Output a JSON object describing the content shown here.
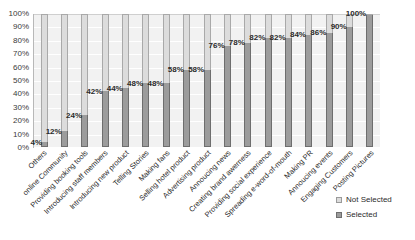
{
  "chart_data": {
    "type": "bar",
    "subtype": "100% stacked column",
    "title": "",
    "xlabel": "",
    "ylabel": "",
    "ylim": [
      0,
      100
    ],
    "ytick_labels": [
      "100%",
      "90%",
      "80%",
      "70%",
      "60%",
      "50%",
      "40%",
      "30%",
      "20%",
      "10%",
      "0%"
    ],
    "ytick_values": [
      100,
      90,
      80,
      70,
      60,
      50,
      40,
      30,
      20,
      10,
      0
    ],
    "grid": true,
    "legend_position": "bottom-right",
    "categories": [
      "Others",
      "online Community",
      "Providing booking tools",
      "Introducing staff members",
      "Introducing new product",
      "Telling Stories",
      "Making fans",
      "Selling hotel product",
      "Advertising product",
      "Annoucing news",
      "Creating brand awerness",
      "Providing social experience",
      "Spreading e-word-of-mouth",
      "Making PR",
      "Annoucing events",
      "Engaging Customers",
      "Posting Pictures"
    ],
    "series": [
      {
        "name": "Not Selected",
        "color": "#dcdcdc",
        "values": [
          96,
          88,
          76,
          58,
          56,
          52,
          52,
          42,
          42,
          24,
          22,
          18,
          18,
          16,
          14,
          10,
          0
        ]
      },
      {
        "name": "Selected",
        "color": "#9c9c9c",
        "values": [
          4,
          12,
          24,
          42,
          44,
          48,
          48,
          58,
          58,
          76,
          78,
          82,
          82,
          84,
          86,
          90,
          100
        ]
      }
    ],
    "data_labels": [
      "4%",
      "12%",
      "24%",
      "42%",
      "44%",
      "48%",
      "48%",
      "58%",
      "58%",
      "76%",
      "78%",
      "82%",
      "82%",
      "84%",
      "86%",
      "90%",
      "100%"
    ]
  },
  "legend": {
    "items": [
      {
        "label": "Not Selected",
        "swatch_class": "not-selected"
      },
      {
        "label": "Selected",
        "swatch_class": "selected"
      }
    ]
  }
}
